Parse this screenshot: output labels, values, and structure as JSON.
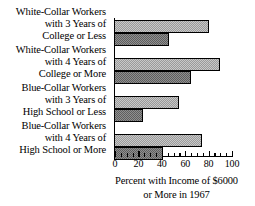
{
  "chart_data": {
    "type": "bar",
    "orientation": "horizontal",
    "title": "",
    "xlabel": "Percent with Income of $6000 or More in 1967",
    "ylabel": "",
    "xlim": [
      0,
      100
    ],
    "xticks": [
      0,
      20,
      40,
      60,
      80,
      100
    ],
    "xtick_labels": [
      "0",
      "20",
      "40",
      "60",
      "80",
      "100"
    ],
    "minor_tick_step": 5,
    "grid": false,
    "legend": false,
    "categories": [
      "White-Collar Workers with 3 Years of College or Less",
      "White-Collar Workers with 4 Years of College or More",
      "Blue-Collar Workers with 3 Years of High School or Less",
      "Blue-Collar Workers with 4 Years of High School or More"
    ],
    "category_lines": [
      [
        "White-Collar Workers",
        "with 3 Years of",
        "College or Less"
      ],
      [
        "White-Collar Workers",
        "with 4 Years of",
        "College or More"
      ],
      [
        "Blue-Collar Workers",
        "with 3 Years of",
        "High School or Less"
      ],
      [
        "Blue-Collar Workers",
        "with 4 Years of",
        "High School or More"
      ]
    ],
    "series": [
      {
        "name": "upper-bar",
        "fill": "light",
        "values": [
          80,
          90,
          55,
          74
        ]
      },
      {
        "name": "lower-bar",
        "fill": "dark",
        "values": [
          46,
          65,
          24,
          41
        ]
      }
    ],
    "colors": {
      "light_fill": "#c8c8c8",
      "dark_fill": "#8f8f8f",
      "outline": "#000000",
      "background": "#ffffff"
    }
  },
  "axis_title_lines": [
    "Percent with Income of $6000",
    "or More in 1967"
  ]
}
